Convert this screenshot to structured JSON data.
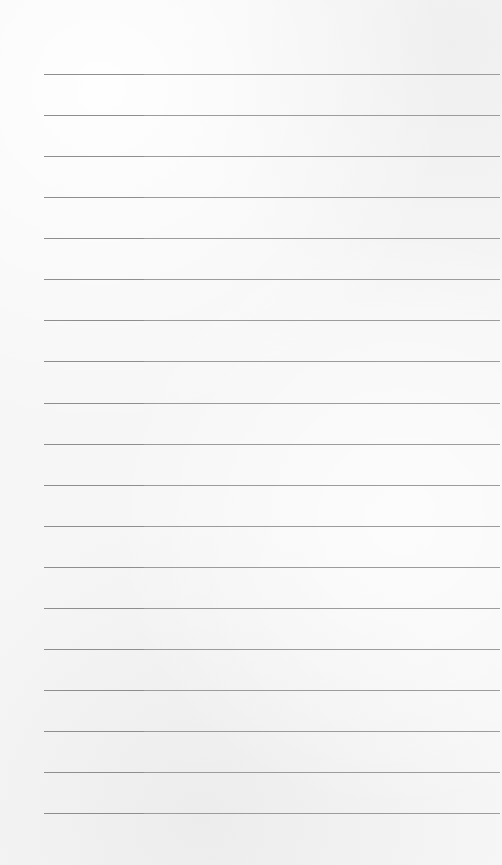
{
  "page": {
    "type": "lined-paper",
    "background_color": "#f6f6f6",
    "line_color": "#9c9c9c",
    "line_left": 44,
    "line_count": 19,
    "lines_y": [
      74,
      115,
      156,
      197,
      238,
      279,
      320,
      361,
      403,
      444,
      485,
      526,
      567,
      608,
      649,
      690,
      731,
      772,
      813
    ]
  }
}
